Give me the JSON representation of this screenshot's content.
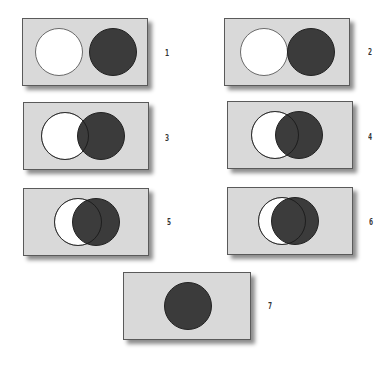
{
  "figure": {
    "colors": {
      "panel_fill": "#d9d9d9",
      "panel_border": "#5a5a5a",
      "white_circle": "#ffffff",
      "dark_circle": "#343434"
    },
    "panels": [
      {
        "label": "1",
        "white_offset": 54
      },
      {
        "label": "2",
        "white_offset": 47
      },
      {
        "label": "3",
        "white_offset": 36
      },
      {
        "label": "4",
        "white_offset": 24
      },
      {
        "label": "5",
        "white_offset": 18
      },
      {
        "label": "6",
        "white_offset": 13
      },
      {
        "label": "7",
        "white_offset": 0
      }
    ]
  }
}
